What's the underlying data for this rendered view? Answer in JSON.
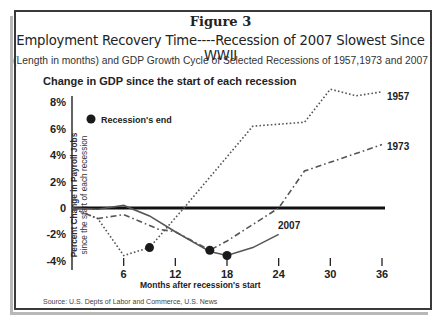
{
  "figure": {
    "label": "Figure 3",
    "title": "Employment Recovery Time----Recession of 2007 Slowest Since WWII",
    "subtitle": "(Length in months) and GDP Growth Cycle of Selected Recessions of 1957,1973 and 2007",
    "source": "Source: U.S. Depts of Labor and Commerce, U.S. News"
  },
  "chart_data": {
    "type": "line",
    "title": "Change in GDP since the start of each recession",
    "xlabel": "Months after recession's start",
    "ylabel": "Percent Change in Payroll Jobs",
    "ylabel_sub": "since the start of each recession",
    "x_ticks": [
      6,
      12,
      18,
      24,
      30,
      36
    ],
    "y_ticks": [
      "8%",
      "6%",
      "4%",
      "2%",
      "0",
      "-2%",
      "-4%"
    ],
    "xlim": [
      0,
      36
    ],
    "ylim": [
      -4,
      9
    ],
    "grid": false,
    "legend": {
      "marker": "filled-circle",
      "label": "Recession's end",
      "position": "upper-left"
    },
    "series": [
      {
        "name": "1957",
        "style": "dotted",
        "x": [
          0,
          3,
          6,
          9,
          13,
          21,
          27,
          30,
          33,
          36
        ],
        "values": [
          0,
          -0.8,
          -3.6,
          -3.0,
          0,
          6.2,
          6.5,
          9.0,
          8.5,
          8.8
        ],
        "recession_end": {
          "x": 9,
          "y": -3.0
        }
      },
      {
        "name": "1973",
        "style": "dash-dot",
        "x": [
          0,
          3,
          6,
          10,
          12,
          16,
          18,
          24,
          27,
          36
        ],
        "values": [
          0,
          -0.8,
          -0.5,
          -1.6,
          -1.8,
          -3.2,
          -2.5,
          0,
          2.8,
          4.8
        ],
        "recession_end": {
          "x": 16,
          "y": -3.2
        }
      },
      {
        "name": "2007",
        "style": "solid",
        "x": [
          0,
          3,
          6,
          9,
          12,
          16,
          18,
          21,
          24
        ],
        "values": [
          0,
          -0.1,
          0.2,
          -0.6,
          -1.8,
          -3.3,
          -3.6,
          -3.0,
          -2.0
        ],
        "recession_end": {
          "x": 18,
          "y": -3.6
        }
      }
    ]
  }
}
